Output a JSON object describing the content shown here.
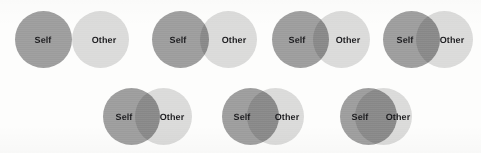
{
  "figure": {
    "name": "Inclusion of Other in the Self (IOS) Scale",
    "background_color": "#fdfdfc",
    "self_color": "#9c9c9c",
    "other_color": "#dcdcdc",
    "overlap_color": "#a9a9a9",
    "label_color": "#17171a",
    "circle_diameter": 57,
    "rows": [
      {
        "name": "top-row",
        "top": 11,
        "item_indices": [
          0,
          1,
          2,
          3
        ]
      },
      {
        "name": "bottom-row",
        "top": 88,
        "item_indices": [
          4,
          5,
          6
        ]
      }
    ]
  },
  "items": [
    {
      "step": 1,
      "self_label": "Self",
      "other_label": "Other",
      "left": 15,
      "top": 11,
      "diameter": 57,
      "overlap_px": 0,
      "self_cx": 43,
      "other_cx": 104,
      "self_label_x": 43,
      "other_label_x": 104,
      "label_y": 40,
      "width": 118
    },
    {
      "step": 2,
      "self_label": "Self",
      "other_label": "Other",
      "left": 152,
      "top": 11,
      "diameter": 57,
      "overlap_px": 9,
      "self_cx": 180,
      "other_cx": 232,
      "self_label_x": 178,
      "other_label_x": 234,
      "label_y": 40,
      "width": 109
    },
    {
      "step": 3,
      "self_label": "Self",
      "other_label": "Other",
      "left": 272,
      "top": 11,
      "diameter": 57,
      "overlap_px": 16,
      "self_cx": 300,
      "other_cx": 345,
      "self_label_x": 297,
      "other_label_x": 348,
      "label_y": 40,
      "width": 102
    },
    {
      "step": 4,
      "self_label": "Self",
      "other_label": "Other",
      "left": 383,
      "top": 11,
      "diameter": 57,
      "overlap_px": 24,
      "self_cx": 411,
      "other_cx": 448,
      "self_label_x": 405,
      "other_label_x": 452,
      "label_y": 40,
      "width": 94
    },
    {
      "step": 5,
      "self_label": "Self",
      "other_label": "Other",
      "left": 103,
      "top": 88,
      "diameter": 57,
      "overlap_px": 25,
      "self_cx": 131,
      "other_cx": 167,
      "self_label_x": 124,
      "other_label_x": 172,
      "label_y": 117,
      "width": 89
    },
    {
      "step": 6,
      "self_label": "Self",
      "other_label": "Other",
      "left": 222,
      "top": 88,
      "diameter": 57,
      "overlap_px": 32,
      "self_cx": 250,
      "other_cx": 279,
      "self_label_x": 242,
      "other_label_x": 287,
      "label_y": 117,
      "width": 86
    },
    {
      "step": 7,
      "self_label": "Self",
      "other_label": "Other",
      "left": 340,
      "top": 88,
      "diameter": 57,
      "overlap_px": 42,
      "self_cx": 368,
      "other_cx": 383,
      "self_label_x": 360,
      "other_label_x": 398,
      "label_y": 117,
      "width": 72
    }
  ]
}
